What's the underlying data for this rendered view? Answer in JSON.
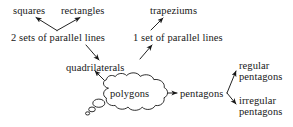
{
  "diagram": {
    "ink_color": "#171717",
    "background_color": "#ffffff",
    "nodes": {
      "squares": "squares",
      "rectangles": "rectangles",
      "trapeziums": "trapeziums",
      "two_sets_parallel": "2 sets of parallel lines",
      "one_set_parallel": "1 set of parallel lines",
      "quadrilaterals": "quadrilaterals",
      "polygons": "polygons",
      "pentagons": "pentagons",
      "regular_line1": "regular",
      "regular_line2": "pentagons",
      "irregular_line1": "irregular",
      "irregular_line2": "pentagons"
    },
    "edges": [
      {
        "id": "two-sets-to-squares",
        "from": "2 sets of parallel lines",
        "to": "squares",
        "arrow": "up-left"
      },
      {
        "id": "two-sets-to-rectangles",
        "from": "2 sets of parallel lines",
        "to": "rectangles",
        "arrow": "up-right"
      },
      {
        "id": "one-set-to-trapeziums",
        "from": "1 set of parallel lines",
        "to": "trapeziums",
        "arrow": "up-right"
      },
      {
        "id": "two-sets-to-quadrilaterals",
        "from": "2 sets of parallel lines",
        "to": "quadrilaterals",
        "arrow": "down-right"
      },
      {
        "id": "quadrilaterals-to-one-set",
        "from": "quadrilaterals",
        "to": "1 set of parallel lines",
        "arrow": "up-right"
      },
      {
        "id": "polygons-to-quadrilaterals",
        "from": "polygons",
        "to": "quadrilaterals",
        "arrow": "up-left"
      },
      {
        "id": "polygons-to-pentagons",
        "from": "polygons",
        "to": "pentagons",
        "arrow": "right"
      },
      {
        "id": "pentagons-to-regular",
        "from": "pentagons",
        "to": "regular pentagons",
        "arrow": "up-right"
      },
      {
        "id": "pentagons-to-irregular",
        "from": "pentagons",
        "to": "irregular pentagons",
        "arrow": "down-right"
      }
    ],
    "thought_bubble": {
      "label": "polygons",
      "trail_bubble_count": 3
    }
  }
}
